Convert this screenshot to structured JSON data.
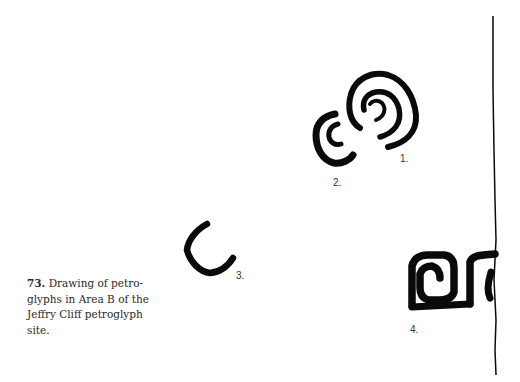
{
  "figure": {
    "number": "73.",
    "caption": "Drawing of petroglyphs in Area B of the Jeffry Cliff petroglyph site.",
    "caption_lines": [
      "Drawing of petro-",
      "glyphs in Area B of the",
      "Jeffry Cliff petroglyph",
      "site."
    ],
    "glyph_labels": [
      "1.",
      "2.",
      "3.",
      "4."
    ],
    "ink_color": "#0a0a0a"
  }
}
